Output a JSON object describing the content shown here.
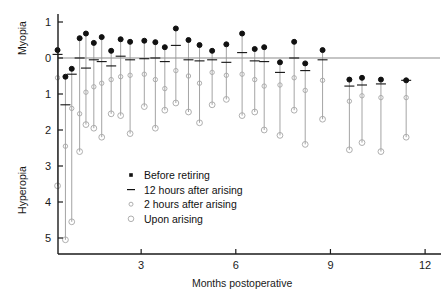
{
  "chart_data": {
    "type": "scatter",
    "title": "",
    "xlabel": "Months postoperative",
    "ylabel_top": "Myopia",
    "ylabel_bottom": "Hyperopia",
    "xlim": [
      0,
      12
    ],
    "ylim_diopters": [
      -1,
      5
    ],
    "xticks": [
      3,
      6,
      9,
      12
    ],
    "xticklabels": [
      "3",
      "6",
      "9",
      "12"
    ],
    "yticks": [
      -1,
      0,
      1,
      2,
      3,
      4,
      5
    ],
    "yticklabels": [
      "1",
      "0",
      "1",
      "2",
      "3",
      "4",
      "5"
    ],
    "grid": false,
    "zero_reference_line": true,
    "legend_position": "inside-center-lower",
    "series": [
      {
        "name": "Before retiring",
        "marker": "filled-square-dot",
        "color": "#111111"
      },
      {
        "name": "12 hours after arising",
        "marker": "dash",
        "color": "#111111"
      },
      {
        "name": "2 hours after arising",
        "marker": "small-open-circle",
        "color": "#a6a6a6"
      },
      {
        "name": "Upon arising",
        "marker": "open-circle",
        "color": "#a6a6a6"
      }
    ],
    "points": [
      {
        "x": 0.35,
        "before": -0.22,
        "h12": -0.1,
        "h2": 0.55,
        "upon": 3.55
      },
      {
        "x": 0.6,
        "before": 0.52,
        "h12": 1.3,
        "h2": 2.45,
        "upon": 5.05
      },
      {
        "x": 0.8,
        "before": 0.3,
        "h12": 0.45,
        "h2": 1.4,
        "upon": 4.55
      },
      {
        "x": 1.05,
        "before": -0.55,
        "h12": 0.0,
        "h2": 1.55,
        "upon": 2.6
      },
      {
        "x": 1.25,
        "before": -0.68,
        "h12": 0.28,
        "h2": 0.95,
        "upon": 1.85
      },
      {
        "x": 1.5,
        "before": -0.42,
        "h12": 0.05,
        "h2": 0.8,
        "upon": 1.95
      },
      {
        "x": 1.75,
        "before": -0.58,
        "h12": 0.1,
        "h2": 0.7,
        "upon": 2.2
      },
      {
        "x": 2.05,
        "before": -0.2,
        "h12": 0.22,
        "h2": 0.6,
        "upon": 1.55
      },
      {
        "x": 2.35,
        "before": -0.52,
        "h12": -0.05,
        "h2": 0.52,
        "upon": 1.6
      },
      {
        "x": 2.65,
        "before": -0.45,
        "h12": 0.05,
        "h2": 0.48,
        "upon": 2.1
      },
      {
        "x": 3.1,
        "before": -0.48,
        "h12": 0.02,
        "h2": 0.45,
        "upon": 1.35
      },
      {
        "x": 3.45,
        "before": -0.44,
        "h12": 0.0,
        "h2": 0.6,
        "upon": 1.95
      },
      {
        "x": 3.75,
        "before": -0.3,
        "h12": 0.1,
        "h2": 0.85,
        "upon": 1.45
      },
      {
        "x": 4.1,
        "before": -0.82,
        "h12": -0.35,
        "h2": 0.35,
        "upon": 1.25
      },
      {
        "x": 4.5,
        "before": -0.5,
        "h12": 0.05,
        "h2": 0.5,
        "upon": 1.5
      },
      {
        "x": 4.85,
        "before": -0.36,
        "h12": 0.08,
        "h2": 0.7,
        "upon": 1.8
      },
      {
        "x": 5.25,
        "before": -0.2,
        "h12": 0.05,
        "h2": 0.4,
        "upon": 1.3
      },
      {
        "x": 5.7,
        "before": -0.38,
        "h12": 0.12,
        "h2": 0.48,
        "upon": 1.15
      },
      {
        "x": 6.2,
        "before": -0.68,
        "h12": -0.15,
        "h2": 0.45,
        "upon": 1.6
      },
      {
        "x": 6.6,
        "before": -0.25,
        "h12": 0.08,
        "h2": 0.6,
        "upon": 1.5
      },
      {
        "x": 6.9,
        "before": -0.3,
        "h12": 0.1,
        "h2": 0.78,
        "upon": 2.0
      },
      {
        "x": 7.4,
        "before": 0.12,
        "h12": 0.4,
        "h2": 0.75,
        "upon": 2.15
      },
      {
        "x": 7.85,
        "before": -0.45,
        "h12": 0.0,
        "h2": 0.55,
        "upon": 1.45
      },
      {
        "x": 8.2,
        "before": 0.15,
        "h12": 0.35,
        "h2": 0.9,
        "upon": 2.4
      },
      {
        "x": 8.75,
        "before": -0.22,
        "h12": 0.05,
        "h2": 0.62,
        "upon": 1.7
      },
      {
        "x": 9.6,
        "before": 0.6,
        "h12": 0.78,
        "h2": 1.2,
        "upon": 2.55
      },
      {
        "x": 10.0,
        "before": 0.55,
        "h12": 0.75,
        "h2": 1.05,
        "upon": 2.35
      },
      {
        "x": 10.6,
        "before": 0.6,
        "h12": 0.72,
        "h2": 1.1,
        "upon": 2.6
      },
      {
        "x": 11.4,
        "before": 0.62,
        "h12": 0.62,
        "h2": 1.1,
        "upon": 2.2
      }
    ]
  },
  "legend": {
    "items": [
      {
        "label": "Before retiring",
        "marker": "filled-dot-icon"
      },
      {
        "label": "12 hours after arising",
        "marker": "dash-icon"
      },
      {
        "label": "2 hours after arising",
        "marker": "small-circle-icon"
      },
      {
        "label": "Upon arising",
        "marker": "circle-icon"
      }
    ]
  }
}
